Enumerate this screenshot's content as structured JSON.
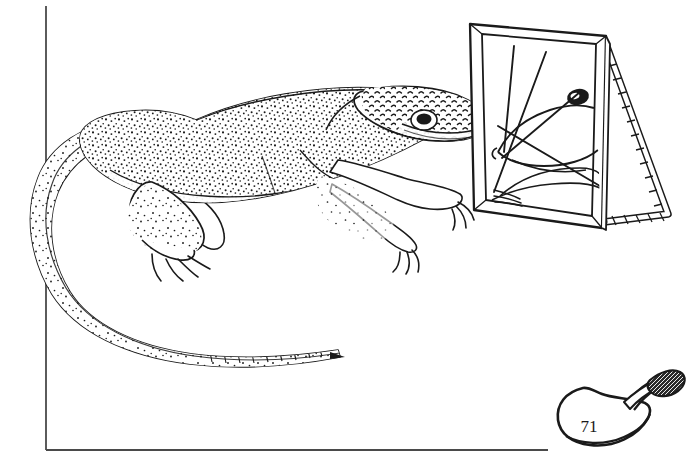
{
  "page": {
    "width": 694,
    "height": 470,
    "background_color": "#ffffff",
    "ink_color": "#1a1a1a"
  },
  "page_number": {
    "label": "71",
    "position": "bottom-right, inside trowel blade"
  },
  "border_rule": {
    "vertical": {
      "x": 46,
      "y_top": 6,
      "y_bottom": 450
    },
    "horizontal": {
      "y": 450,
      "x_left": 46,
      "x_right": 548
    },
    "color": "#4a4a4a",
    "width": 1.6
  },
  "figure": {
    "style": "pen-and-ink stipple line drawing",
    "elements": [
      {
        "name": "lizard",
        "description": "large stippled lizard facing right, long curving tail looping left and downward"
      },
      {
        "name": "mirror",
        "description": "rectangular framed mirror propped upright on a braided cord stand, reflecting the lizard's head with scratch marks across the glass"
      },
      {
        "name": "trowel",
        "description": "garden trowel vignette at bottom right containing the page number"
      }
    ]
  },
  "lizard": {
    "parts": [
      "head",
      "eye",
      "snout",
      "body",
      "tail",
      "front-leg-near",
      "front-leg-far",
      "hind-leg-near",
      "hind-leg-far",
      "claws"
    ],
    "texture": "dense stipple dots over back and flanks, scale pattern on head"
  },
  "mirror": {
    "frame_color": "#1a1a1a",
    "glass_color": "#ffffff",
    "reflection": "lizard head profile with dark eye",
    "scratches": 4,
    "stand": "braided rope triangle support at right"
  },
  "trowel": {
    "blade": "pointed spade blade outline",
    "handle": "cross-hatched dark handle angled upper right"
  }
}
